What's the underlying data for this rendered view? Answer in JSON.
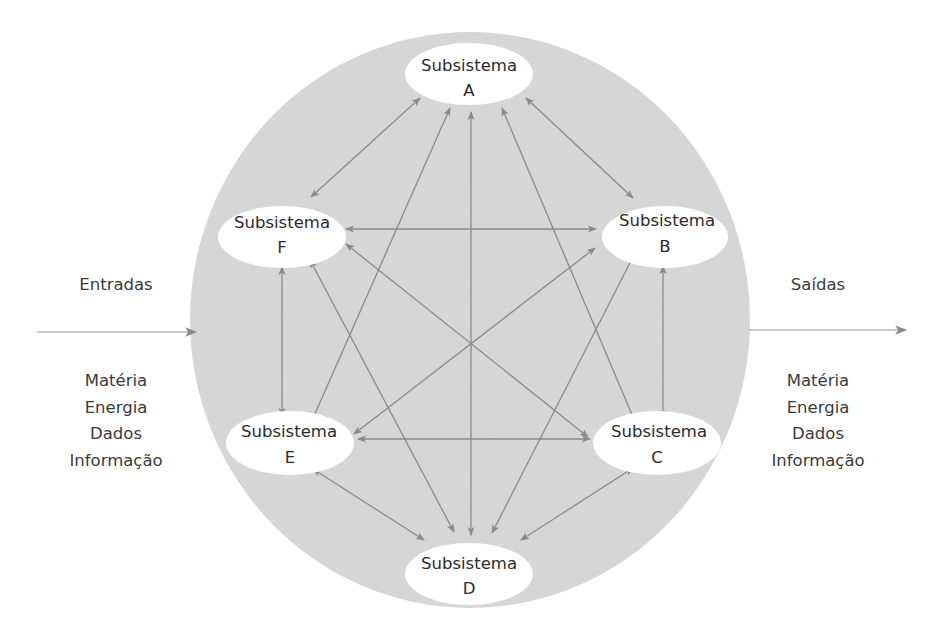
{
  "diagram": {
    "type": "system-subsystems",
    "colors": {
      "system_fill": "#d8d8d8",
      "node_fill": "#ffffff",
      "arrow": "#8a8a8a",
      "text": "#2b2b2b"
    },
    "nodes": [
      {
        "id": "A",
        "line1": "Subsistema",
        "line2": "A",
        "cx": 469,
        "cy": 74
      },
      {
        "id": "B",
        "line1": "Subsistema",
        "line2": "B",
        "cx": 665,
        "cy": 237
      },
      {
        "id": "C",
        "line1": "Subsistema",
        "line2": "C",
        "cx": 657,
        "cy": 443
      },
      {
        "id": "D",
        "line1": "Subsistema",
        "line2": "D",
        "cx": 469,
        "cy": 574
      },
      {
        "id": "E",
        "line1": "Subsistema",
        "line2": "E",
        "cx": 290,
        "cy": 443
      },
      {
        "id": "F",
        "line1": "Subsistema",
        "line2": "F",
        "cx": 282,
        "cy": 237
      }
    ],
    "edges": [
      {
        "from": "A",
        "to": "F",
        "bidirectional": true
      },
      {
        "from": "A",
        "to": "B",
        "bidirectional": true
      },
      {
        "from": "A",
        "to": "E",
        "bidirectional": true
      },
      {
        "from": "A",
        "to": "D",
        "bidirectional": true
      },
      {
        "from": "A",
        "to": "C",
        "bidirectional": true
      },
      {
        "from": "F",
        "to": "B",
        "bidirectional": true
      },
      {
        "from": "F",
        "to": "C",
        "bidirectional": true
      },
      {
        "from": "F",
        "to": "D",
        "bidirectional": true
      },
      {
        "from": "F",
        "to": "E",
        "bidirectional": true
      },
      {
        "from": "B",
        "to": "E",
        "bidirectional": true
      },
      {
        "from": "B",
        "to": "D",
        "bidirectional": true
      },
      {
        "from": "B",
        "to": "C",
        "bidirectional": true
      },
      {
        "from": "E",
        "to": "C",
        "bidirectional": true
      },
      {
        "from": "E",
        "to": "D",
        "bidirectional": true
      },
      {
        "from": "C",
        "to": "D",
        "bidirectional": true
      }
    ]
  },
  "inputs": {
    "title": "Entradas",
    "items": [
      "Matéria",
      "Energia",
      "Dados",
      "Informação"
    ]
  },
  "outputs": {
    "title": "Saídas",
    "items": [
      "Matéria",
      "Energia",
      "Dados",
      "Informação"
    ]
  }
}
